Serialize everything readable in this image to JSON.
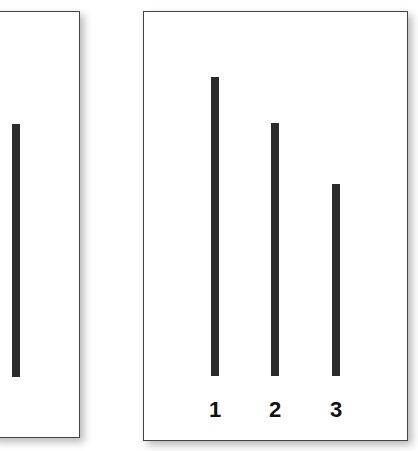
{
  "left_card": {
    "lines": [
      {
        "id": "reference",
        "top": 123,
        "bottom": 376
      }
    ]
  },
  "right_card": {
    "lines": [
      {
        "label": "1",
        "top": 76,
        "bottom": 375
      },
      {
        "label": "2",
        "top": 122,
        "bottom": 375
      },
      {
        "label": "3",
        "top": 183,
        "bottom": 375
      }
    ]
  },
  "labels": [
    "1",
    "2",
    "3"
  ],
  "colors": {
    "line": "#2a2a2a",
    "border": "#444444",
    "background": "#ffffff"
  }
}
